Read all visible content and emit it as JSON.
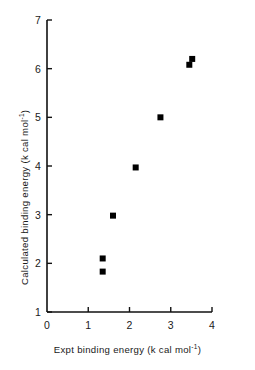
{
  "chart_data": {
    "type": "scatter",
    "title": "",
    "xlabel": "Expt binding  energy (k cal mol-1)",
    "ylabel": "Calculated binding energy (k cal mol-1)",
    "xlim": [
      0,
      4
    ],
    "ylim": [
      1,
      7
    ],
    "xticks": [
      "0",
      "1",
      "2",
      "3",
      "4"
    ],
    "yticks": [
      "1",
      "2",
      "3",
      "4",
      "5",
      "6",
      "7"
    ],
    "xtick_values": [
      0,
      1,
      2,
      3,
      4
    ],
    "ytick_values": [
      1,
      2,
      3,
      4,
      5,
      6,
      7
    ],
    "grid": false,
    "legend": false,
    "marker": "filled-square",
    "marker_color": "#000000",
    "marker_size_px": 6,
    "points": [
      {
        "x": 1.35,
        "y": 2.1
      },
      {
        "x": 1.35,
        "y": 1.83
      },
      {
        "x": 1.6,
        "y": 2.98
      },
      {
        "x": 2.15,
        "y": 3.97
      },
      {
        "x": 2.75,
        "y": 5.0
      },
      {
        "x": 3.45,
        "y": 6.08
      },
      {
        "x": 3.52,
        "y": 6.2
      }
    ]
  },
  "axes": {
    "x_title_prefix": "Expt binding  energy (k cal mol",
    "x_title_sup": "-1",
    "x_title_suffix": ")",
    "y_title_prefix": "Calculated binding energy (k cal mol",
    "y_title_sup": "-1",
    "y_title_suffix": ")",
    "axis_color": "#111111",
    "axis_width_px": 1.6
  },
  "labels": {
    "x": [
      "0",
      "1",
      "2",
      "3",
      "4"
    ],
    "y": [
      "1",
      "2",
      "3",
      "4",
      "5",
      "6",
      "7"
    ]
  }
}
